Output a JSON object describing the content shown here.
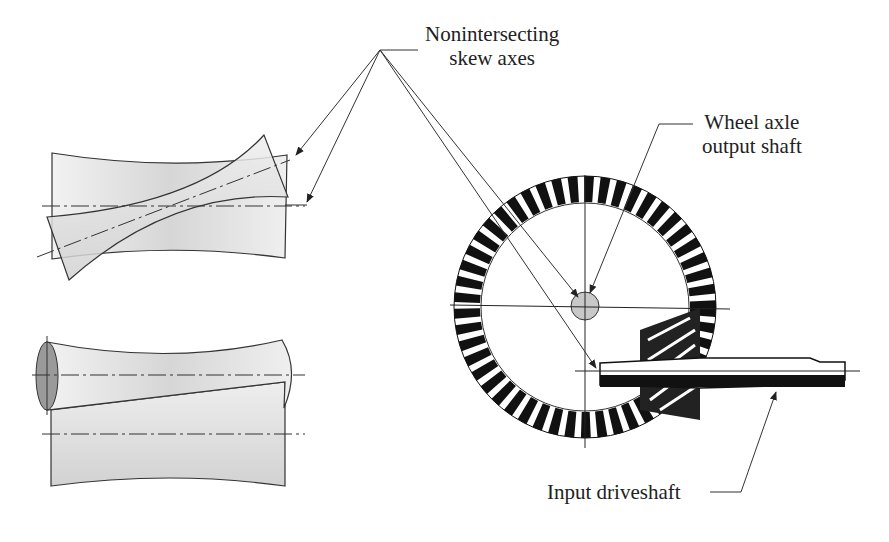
{
  "diagram": {
    "type": "engineering-illustration",
    "labels": {
      "skew_axes": {
        "line1": "Nonintersecting",
        "line2": "skew axes"
      },
      "wheel_axle": {
        "line1": "Wheel axle",
        "line2": "output shaft"
      },
      "input_driveshaft": {
        "line1": "Input driveshaft"
      }
    },
    "components": [
      "top-view-hyperboloid-pair",
      "side-view-hyperboloid-pair",
      "ring-gear",
      "pinion-gear",
      "pinion-shaft"
    ],
    "colors": {
      "line": "#333333",
      "fill_light": "#e6e6e6",
      "fill_mid": "#d4d4d4",
      "end_face": "#9a9a9a",
      "gear_teeth": "#111111"
    }
  }
}
